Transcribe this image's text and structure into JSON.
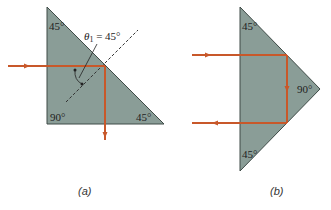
{
  "figure_a": {
    "caption": "(a)",
    "angle_top": "45°",
    "angle_bottom_left": "90°",
    "angle_bottom_right": "45°",
    "theta_label": "θ",
    "theta_subscript": "1",
    "theta_value": " = 45°"
  },
  "figure_b": {
    "caption": "(b)",
    "angle_top": "45°",
    "angle_right": "90°",
    "angle_bottom": "45°"
  },
  "colors": {
    "prism_fill": "#8a9d97",
    "prism_stroke": "#3e4a46",
    "ray": "#c8582a",
    "normal": "#333333"
  }
}
